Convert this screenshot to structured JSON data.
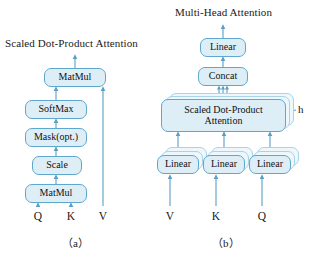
{
  "figure": {
    "panel_a": {
      "title": "Scaled Dot-Product Attention",
      "caption": "（a）",
      "boxes": [
        {
          "label": "MatMul",
          "x": 44,
          "y": 68,
          "w": 62,
          "h": 19
        },
        {
          "label": "SoftMax",
          "x": 25,
          "y": 100,
          "w": 62,
          "h": 19
        },
        {
          "label": "Mask(opt.)",
          "x": 25,
          "y": 128,
          "w": 62,
          "h": 19
        },
        {
          "label": "Scale",
          "x": 32,
          "y": 156,
          "w": 50,
          "h": 19
        },
        {
          "label": "MatMul",
          "x": 25,
          "y": 184,
          "w": 62,
          "h": 19
        }
      ],
      "inputs": [
        {
          "label": "Q",
          "x": 35,
          "y": 212
        },
        {
          "label": "K",
          "x": 67,
          "y": 212
        },
        {
          "label": "V",
          "x": 100,
          "y": 212
        }
      ]
    },
    "panel_b": {
      "title": "Multi-Head Attention",
      "caption": "（b）",
      "head_count_label": "h",
      "boxes": [
        {
          "label": "Linear",
          "x": 200,
          "y": 38,
          "w": 46,
          "h": 19
        },
        {
          "label": "Concat",
          "x": 198,
          "y": 67,
          "w": 50,
          "h": 19
        },
        {
          "label": "Scaled Dot-Product Attention",
          "x": 161,
          "y": 99,
          "w": 125,
          "h": 33
        },
        {
          "label": "Linear",
          "x": 157,
          "y": 155,
          "w": 42,
          "h": 19
        },
        {
          "label": "Linear",
          "x": 203,
          "y": 155,
          "w": 42,
          "h": 19
        },
        {
          "label": "Linear",
          "x": 249,
          "y": 155,
          "w": 42,
          "h": 19
        }
      ],
      "inputs": [
        {
          "label": "V",
          "x": 166,
          "y": 212
        },
        {
          "label": "K",
          "x": 212,
          "y": 212
        },
        {
          "label": "Q",
          "x": 258,
          "y": 212
        }
      ]
    },
    "colors": {
      "box_fill": "#deeef7",
      "box_border": "#5ea8cd",
      "ghost_fill": "#eef7fb",
      "ghost_border": "#a9d3e6",
      "wire": "#5a9fc4",
      "text": "#111111",
      "background": "#ffffff"
    }
  }
}
